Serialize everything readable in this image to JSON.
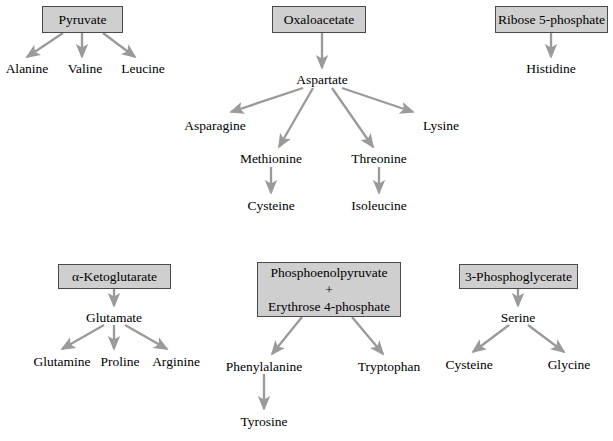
{
  "diagram": {
    "box_fill": "#cfcfcf",
    "box_border": "#4a4a4a",
    "arrow_color": "#9a9a9a",
    "text_color": "#000000"
  },
  "boxes": [
    {
      "id": "pyruvate",
      "label": "Pyruvate",
      "lines": [
        "Pyruvate"
      ]
    },
    {
      "id": "oxaloacetate",
      "label": "Oxaloacetate",
      "lines": [
        "Oxaloacetate"
      ]
    },
    {
      "id": "ribose-5-phosphate",
      "label": "Ribose 5-phosphate",
      "lines": [
        "Ribose 5-phosphate"
      ]
    },
    {
      "id": "alpha-ketoglutarate",
      "label": "α-Ketoglutarate",
      "lines": [
        "α-Ketoglutarate"
      ]
    },
    {
      "id": "pep-erythrose",
      "label": "Phosphoenolpyruvate + Erythrose 4-phosphate",
      "lines": [
        "Phosphoenolpyruvate",
        "+",
        "Erythrose 4-phosphate"
      ]
    },
    {
      "id": "3-phosphoglycerate",
      "label": "3-Phosphoglycerate",
      "lines": [
        "3-Phosphoglycerate"
      ]
    }
  ],
  "labels": [
    {
      "id": "alanine",
      "text": "Alanine"
    },
    {
      "id": "valine",
      "text": "Valine"
    },
    {
      "id": "leucine",
      "text": "Leucine"
    },
    {
      "id": "aspartate",
      "text": "Aspartate"
    },
    {
      "id": "asparagine",
      "text": "Asparagine"
    },
    {
      "id": "lysine",
      "text": "Lysine"
    },
    {
      "id": "methionine",
      "text": "Methionine"
    },
    {
      "id": "threonine",
      "text": "Threonine"
    },
    {
      "id": "cysteine-asp",
      "text": "Cysteine"
    },
    {
      "id": "isoleucine",
      "text": "Isoleucine"
    },
    {
      "id": "histidine",
      "text": "Histidine"
    },
    {
      "id": "glutamate",
      "text": "Glutamate"
    },
    {
      "id": "glutamine",
      "text": "Glutamine"
    },
    {
      "id": "proline",
      "text": "Proline"
    },
    {
      "id": "arginine",
      "text": "Arginine"
    },
    {
      "id": "phenylalanine",
      "text": "Phenylalanine"
    },
    {
      "id": "tryptophan",
      "text": "Tryptophan"
    },
    {
      "id": "tyrosine",
      "text": "Tyrosine"
    },
    {
      "id": "serine",
      "text": "Serine"
    },
    {
      "id": "cysteine-ser",
      "text": "Cysteine"
    },
    {
      "id": "glycine",
      "text": "Glycine"
    }
  ],
  "pathways": [
    {
      "from": "Pyruvate",
      "to": "Alanine"
    },
    {
      "from": "Pyruvate",
      "to": "Valine"
    },
    {
      "from": "Pyruvate",
      "to": "Leucine"
    },
    {
      "from": "Oxaloacetate",
      "to": "Aspartate"
    },
    {
      "from": "Aspartate",
      "to": "Asparagine"
    },
    {
      "from": "Aspartate",
      "to": "Methionine"
    },
    {
      "from": "Aspartate",
      "to": "Threonine"
    },
    {
      "from": "Aspartate",
      "to": "Lysine"
    },
    {
      "from": "Methionine",
      "to": "Cysteine"
    },
    {
      "from": "Threonine",
      "to": "Isoleucine"
    },
    {
      "from": "Ribose 5-phosphate",
      "to": "Histidine"
    },
    {
      "from": "α-Ketoglutarate",
      "to": "Glutamate"
    },
    {
      "from": "Glutamate",
      "to": "Glutamine"
    },
    {
      "from": "Glutamate",
      "to": "Proline"
    },
    {
      "from": "Glutamate",
      "to": "Arginine"
    },
    {
      "from": "Phosphoenolpyruvate + Erythrose 4-phosphate",
      "to": "Phenylalanine"
    },
    {
      "from": "Phosphoenolpyruvate + Erythrose 4-phosphate",
      "to": "Tryptophan"
    },
    {
      "from": "Phenylalanine",
      "to": "Tyrosine"
    },
    {
      "from": "3-Phosphoglycerate",
      "to": "Serine"
    },
    {
      "from": "Serine",
      "to": "Cysteine"
    },
    {
      "from": "Serine",
      "to": "Glycine"
    }
  ]
}
